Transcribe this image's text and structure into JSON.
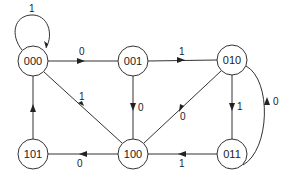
{
  "diagram": {
    "type": "state-transition-diagram",
    "nodes": [
      {
        "id": "000",
        "label": "000",
        "x": 33,
        "y": 61
      },
      {
        "id": "001",
        "label": "001",
        "x": 133,
        "y": 61
      },
      {
        "id": "010",
        "label": "010",
        "x": 232,
        "y": 60
      },
      {
        "id": "101",
        "label": "101",
        "x": 33,
        "y": 154
      },
      {
        "id": "100",
        "label": "100",
        "x": 133,
        "y": 154
      },
      {
        "id": "011",
        "label": "011",
        "x": 232,
        "y": 154
      }
    ],
    "edges": [
      {
        "from": "000",
        "to": "000",
        "label": "1"
      },
      {
        "from": "000",
        "to": "001",
        "label": "0"
      },
      {
        "from": "001",
        "to": "010",
        "label": "1"
      },
      {
        "from": "001",
        "to": "100",
        "label": "0"
      },
      {
        "from": "010",
        "to": "100",
        "label": "0"
      },
      {
        "from": "010",
        "to": "011",
        "label": "1"
      },
      {
        "from": "011",
        "to": "010",
        "label": "0"
      },
      {
        "from": "011",
        "to": "100",
        "label": "1"
      },
      {
        "from": "100",
        "to": "000",
        "label": "1"
      },
      {
        "from": "100",
        "to": "101",
        "label": "0"
      },
      {
        "from": "101",
        "to": "000",
        "label": ""
      }
    ]
  }
}
